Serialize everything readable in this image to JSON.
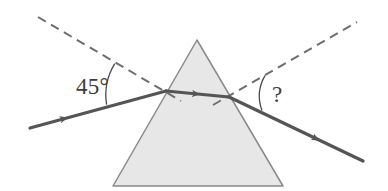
{
  "figure": {
    "name": "prism-refraction-diagram",
    "type": "optics-ray-diagram",
    "background_color": "#ffffff"
  },
  "labels": {
    "incident_angle": "45°",
    "refracted_angle": "?"
  },
  "colors": {
    "prism_fill": "#e7e7e7",
    "prism_stroke": "#8a8a8a",
    "ray_color": "#555555",
    "dashed_normal_color": "#6e6e6e",
    "arc_color": "#4a4a4a",
    "text_color": "#3c3c3c"
  },
  "geometry": {
    "prism": {
      "name": "triangular-prism",
      "apex": [
        197,
        40
      ],
      "base_left": [
        113,
        186
      ],
      "base_right": [
        283,
        186
      ],
      "points": "197,40 283,186 113,186"
    },
    "incident_ray": {
      "name": "incident-ray",
      "from": [
        30,
        128
      ],
      "to": [
        166,
        91
      ],
      "arrow_at": [
        63,
        119
      ],
      "stroke_width": 3.2
    },
    "internal_ray": {
      "name": "internal-ray",
      "from": [
        166,
        91
      ],
      "to": [
        229,
        97
      ],
      "arrow_at": [
        194,
        94
      ],
      "stroke_width": 3.2
    },
    "refracted_ray": {
      "name": "refracted-ray",
      "from": [
        229,
        97
      ],
      "to": [
        363,
        161
      ],
      "arrow_at": [
        314,
        140
      ],
      "stroke_width": 3.2
    },
    "normal_left": {
      "name": "normal-line-left",
      "from": [
        38,
        17
      ],
      "to": [
        181,
        101
      ],
      "dash": "9,6",
      "stroke_width": 2.0
    },
    "normal_right": {
      "name": "normal-line-right",
      "from": [
        213,
        105
      ],
      "to": [
        357,
        22
      ],
      "dash": "9,6",
      "stroke_width": 2.0
    },
    "arc_incident": {
      "name": "angle-arc-incident",
      "path": "M 114.8 63.6 A 60 60 0 0 0 106.6 104.6",
      "stroke_width": 1.3
    },
    "arc_refracted": {
      "name": "angle-arc-refracted",
      "path": "M 265.0 75.6 A 41 41 0 0 0 262.0 110.5",
      "stroke_width": 1.3
    }
  }
}
